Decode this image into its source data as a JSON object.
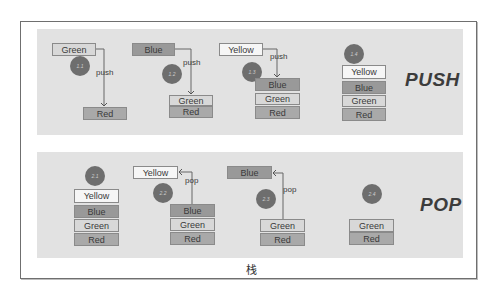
{
  "caption": "栈",
  "colors": {
    "panel_bg": "#e2e2e2",
    "red": "#a9a9a9",
    "green": "#d8d8d8",
    "blue": "#999999",
    "yellow": "#f6f6f6",
    "badge": "#6e6e6e"
  },
  "push_panel": {
    "title": "PUSH",
    "steps": [
      {
        "badge": "1.1",
        "incoming": "Green",
        "op": "push",
        "stack": [
          "Red"
        ]
      },
      {
        "badge": "1.2",
        "incoming": "Blue",
        "op": "push",
        "stack": [
          "Green",
          "Red"
        ]
      },
      {
        "badge": "1.3",
        "incoming": "Yellow",
        "op": "push",
        "stack": [
          "Blue",
          "Green",
          "Red"
        ]
      },
      {
        "badge": "1.4",
        "stack": [
          "Yellow",
          "Blue",
          "Green",
          "Red"
        ]
      }
    ]
  },
  "pop_panel": {
    "title": "POP",
    "steps": [
      {
        "badge": "2.1",
        "stack": [
          "Yellow",
          "Blue",
          "Green",
          "Red"
        ]
      },
      {
        "badge": "2.2",
        "outgoing": "Yellow",
        "op": "pop",
        "stack": [
          "Blue",
          "Green",
          "Red"
        ]
      },
      {
        "badge": "2.3",
        "outgoing": "Blue",
        "op": "pop",
        "stack": [
          "Green",
          "Red"
        ]
      },
      {
        "badge": "2.4",
        "stack": [
          "Green",
          "Red"
        ]
      }
    ]
  }
}
